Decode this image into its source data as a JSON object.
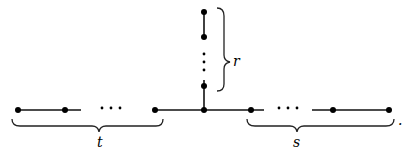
{
  "diagram": {
    "type": "tree / graph with three branches",
    "labels": {
      "left_branch": "t",
      "vertical_branch": "r",
      "right_branch": "s",
      "trailing_punct": "."
    },
    "ellipsis": "···",
    "center_node": {
      "x": 204,
      "y": 110
    },
    "left_branch_nodes_x": [
      18,
      65,
      155
    ],
    "right_branch_nodes_x": [
      251,
      333,
      389
    ],
    "vertical_branch_nodes_y": [
      12,
      37,
      86
    ],
    "colors": {
      "line": "#111111",
      "node": "#000000",
      "background": "#ffffff"
    }
  }
}
